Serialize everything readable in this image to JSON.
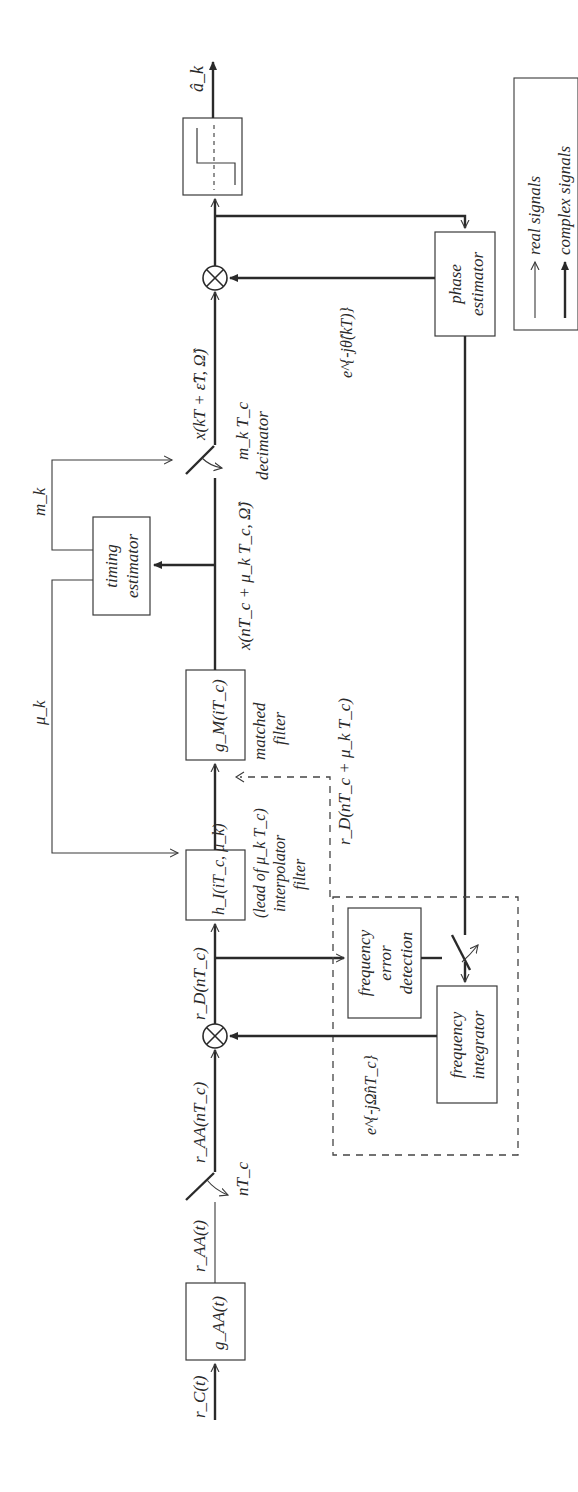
{
  "diagram": {
    "orientation": "rotated -90 degrees",
    "signals": {
      "input": "r_C(t)",
      "after_antialias": "r_AA(t)",
      "sampled": "r_AA(nT_c)",
      "derotated": "r_D(nT_c)",
      "interpolated": "r_D(nT_c + μ_k T_c)",
      "matched_out": "x(nT_c + μ_k T_c, Ω̂)",
      "decimated": "x(kT + ε̂T, Ω̂)",
      "output": "â_k",
      "freq_correction": "e^{-jΩ̂nT_c}",
      "phase_correction": "e^{-jθ̂(kT)}",
      "mu": "μ_k",
      "m": "m_k"
    },
    "blocks": {
      "antialias": "g_AA(t)",
      "interpolator": "h_I(iT_c, μ_k)",
      "interpolator_caption": [
        "(lead of μ_k T_c)",
        "interpolator",
        "filter"
      ],
      "matched": "g_M(iT_c)",
      "matched_caption": [
        "matched",
        "filter"
      ],
      "timing": [
        "timing",
        "estimator"
      ],
      "decimator_clock": "m_k T_c",
      "decimator_caption": "decimator",
      "sampler_clock": "nT_c",
      "phase": [
        "phase",
        "estimator"
      ],
      "freq_error": [
        "frequency",
        "error",
        "detection"
      ],
      "freq_integrator": [
        "frequency",
        "integrator"
      ]
    },
    "legend": {
      "real": "real signals",
      "complex": "complex signals"
    }
  }
}
